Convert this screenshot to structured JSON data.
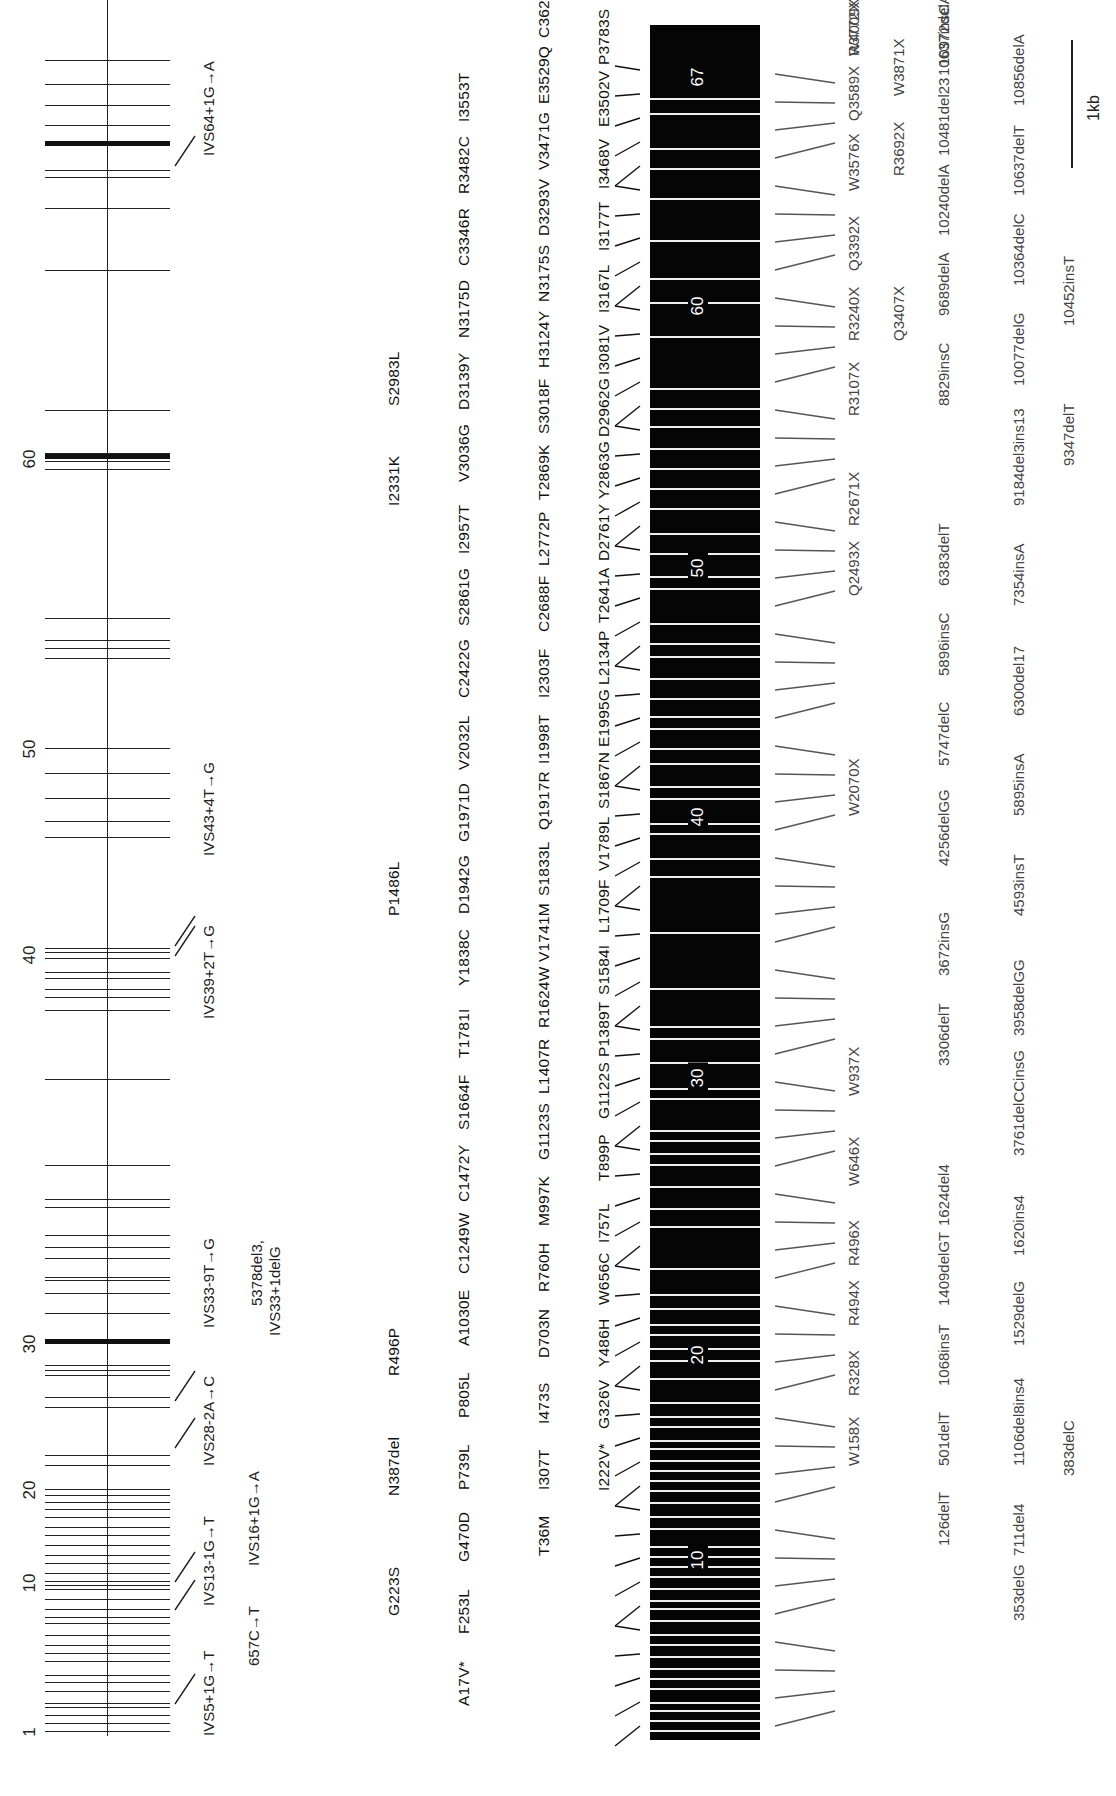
{
  "figure": {
    "gene_axis": {
      "exon_number_labels": [
        "1",
        "10",
        "20",
        "30",
        "40",
        "50",
        "60"
      ],
      "intronic_mutations_top_row": [
        "IVS5+1G→T",
        "IVS13-1G→T",
        "IVS28-2A→C",
        "IVS33-9T→G",
        "IVS39+2T→G",
        "IVS43+4T→G",
        "IVS64+1G→A"
      ],
      "intronic_mutations_bottom_row": [
        "657C→T",
        "IVS16+1G→A",
        "5378del3,",
        "IVS33+1delG"
      ]
    },
    "protein_bar": {
      "exon_markers": [
        "10",
        "20",
        "30",
        "40",
        "50",
        "60",
        "67"
      ]
    },
    "missense_rows": {
      "row1": [
        "G223S",
        "N387del",
        "R496P",
        "P1486L",
        "I2331K",
        "S2983L"
      ],
      "row2": [
        "A17V*",
        "F253L",
        "G470D",
        "P739L",
        "P805L",
        "A1030E",
        "C1249W",
        "C1472Y",
        "S1664F",
        "T1781I",
        "Y1838C",
        "D1942G",
        "G1971D",
        "V2032L",
        "C2422G",
        "S2861G",
        "I2957T",
        "V3036G",
        "D3139Y",
        "N3175D",
        "C3346R",
        "R3482C",
        "I3553T"
      ],
      "row3": [
        "T36M",
        "I307T",
        "I473S",
        "D703N",
        "R760H",
        "M997K",
        "G1123S",
        "L1407R",
        "R1624W",
        "V1741M",
        "S1833L",
        "Q1917R",
        "I1998T",
        "I2303F",
        "C2688F",
        "L2772P",
        "T2869K",
        "S3018F",
        "H3124Y",
        "N3175S",
        "D3293V",
        "V3471G",
        "E3529Q",
        "C3622Y"
      ],
      "row4": [
        "I222V*",
        "G326V",
        "Y486H",
        "W656C",
        "I757L",
        "T899P",
        "G1122S",
        "P1389T",
        "S1584I",
        "L1709F",
        "V1789L",
        "S1867N",
        "E1995G",
        "L2134P",
        "T2641A",
        "D2761Y",
        "Y2863G",
        "D2962G",
        "I3081V",
        "I3167L",
        "I3177T",
        "I3468V",
        "E3502V",
        "P3783S"
      ]
    },
    "truncating_rows": {
      "nonsense_row1": [
        "W158X",
        "R328X",
        "R494X",
        "R496X",
        "W646X",
        "W937X",
        "W2070X",
        "Q2493X",
        "R2671X",
        "R3107X",
        "R3240X",
        "Q3392X",
        "W3576X",
        "Q3589X",
        "R3772X",
        "W4009X"
      ],
      "nonsense_row2": [
        "Q3407X",
        "R3692X",
        "W3871X"
      ],
      "frameshift_row1": [
        "126delT",
        "501delT",
        "1068insT",
        "1409delGT",
        "1624del4",
        "3306delT",
        "3672insG",
        "4256delGG",
        "5747delC",
        "5896insC",
        "6383delT",
        "8829insC",
        "9689delA",
        "10240delA",
        "10481del23",
        "10637insC",
        "10972delAT"
      ],
      "frameshift_row2": [
        "353delG",
        "711del4",
        "1106del8ins4",
        "1529delG",
        "1620ins4",
        "3761delCCinsG",
        "3958delGG",
        "4593insT",
        "5895insA",
        "6300del17",
        "7354insA",
        "9184del3ins13",
        "10077delG",
        "10364delC",
        "10637delT",
        "10856delA"
      ],
      "frameshift_row3": [
        "383delC",
        "9347delT",
        "10452insT"
      ]
    },
    "scale_bar": {
      "label": "1kb"
    },
    "colors": {
      "bar": "#050505",
      "line": "#222222",
      "truncating_text": "#444444"
    }
  }
}
